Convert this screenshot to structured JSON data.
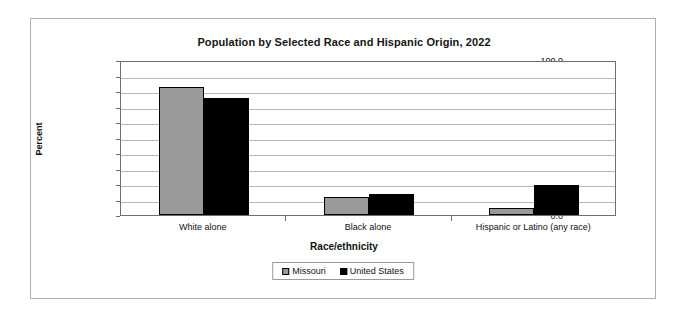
{
  "chart_data": {
    "type": "bar",
    "title": "Population by Selected Race and Hispanic Origin, 2022",
    "xlabel": "Race/ethnicity",
    "ylabel": "Percent",
    "categories": [
      "White alone",
      "Black alone",
      "Hispanic or Latino (any race)"
    ],
    "series": [
      {
        "name": "Missouri",
        "color": "#9a9a9a",
        "values": [
          82.8,
          11.6,
          4.8
        ]
      },
      {
        "name": "United States",
        "color": "#000000",
        "values": [
          75.5,
          13.6,
          19.1
        ]
      }
    ],
    "ylim": [
      0,
      100
    ],
    "ytick_labels": [
      "100.0",
      "90.0",
      "80.0",
      "70.0",
      "60.0",
      "50.0",
      "40.0",
      "30.0",
      "20.0",
      "10.0",
      "0.0"
    ],
    "ytick_values": [
      100,
      90,
      80,
      70,
      60,
      50,
      40,
      30,
      20,
      10,
      0
    ],
    "grid": true,
    "legend_position": "bottom"
  },
  "legend": {
    "items": [
      {
        "label": "Missouri"
      },
      {
        "label": "United States"
      }
    ]
  }
}
